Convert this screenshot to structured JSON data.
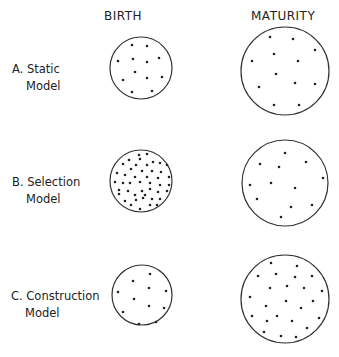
{
  "headers": {
    "birth": "BIRTH",
    "maturity": "MATURITY"
  },
  "rows": [
    {
      "letter": "A.",
      "name": "Static",
      "suffix": "Model"
    },
    {
      "letter": "B.",
      "name": "Selection",
      "suffix": "Model"
    },
    {
      "letter": "C.",
      "name": "Construction",
      "suffix": "Model"
    }
  ],
  "circles": [
    {
      "id": "A-birth",
      "cx": 141,
      "cy": 68,
      "r": 31,
      "dots": [
        [
          132,
          45
        ],
        [
          147,
          46
        ],
        [
          118,
          61
        ],
        [
          133,
          59
        ],
        [
          147,
          62
        ],
        [
          159,
          58
        ],
        [
          135,
          72
        ],
        [
          147,
          78
        ],
        [
          162,
          77
        ],
        [
          123,
          80
        ],
        [
          132,
          92
        ],
        [
          152,
          91
        ]
      ]
    },
    {
      "id": "A-maturity",
      "cx": 285,
      "cy": 71,
      "r": 44,
      "dots": [
        [
          270,
          37
        ],
        [
          293,
          39
        ],
        [
          315,
          50
        ],
        [
          252,
          61
        ],
        [
          274,
          54
        ],
        [
          298,
          61
        ],
        [
          276,
          74
        ],
        [
          259,
          87
        ],
        [
          295,
          83
        ],
        [
          315,
          84
        ],
        [
          274,
          105
        ],
        [
          299,
          105
        ]
      ]
    },
    {
      "id": "B-birth",
      "cx": 141,
      "cy": 181,
      "r": 31,
      "dots": [
        [
          139,
          155
        ],
        [
          147,
          154
        ],
        [
          129,
          160
        ],
        [
          140,
          159
        ],
        [
          153,
          162
        ],
        [
          160,
          163
        ],
        [
          123,
          164
        ],
        [
          136,
          165
        ],
        [
          147,
          165
        ],
        [
          167,
          165
        ],
        [
          131,
          169
        ],
        [
          142,
          171
        ],
        [
          152,
          171
        ],
        [
          161,
          172
        ],
        [
          117,
          173
        ],
        [
          125,
          175
        ],
        [
          135,
          177
        ],
        [
          147,
          177
        ],
        [
          158,
          178
        ],
        [
          169,
          177
        ],
        [
          115,
          182
        ],
        [
          123,
          183
        ],
        [
          130,
          183
        ],
        [
          140,
          182
        ],
        [
          150,
          183
        ],
        [
          160,
          185
        ],
        [
          169,
          185
        ],
        [
          119,
          190
        ],
        [
          128,
          191
        ],
        [
          142,
          191
        ],
        [
          150,
          189
        ],
        [
          158,
          192
        ],
        [
          167,
          191
        ],
        [
          119,
          194
        ],
        [
          135,
          195
        ],
        [
          145,
          195
        ],
        [
          125,
          201
        ],
        [
          136,
          200
        ],
        [
          143,
          198
        ],
        [
          152,
          199
        ],
        [
          160,
          199
        ],
        [
          131,
          205
        ],
        [
          150,
          205
        ],
        [
          157,
          205
        ],
        [
          140,
          209
        ]
      ]
    },
    {
      "id": "B-maturity",
      "cx": 285,
      "cy": 183,
      "r": 43,
      "dots": [
        [
          285,
          153
        ],
        [
          260,
          164
        ],
        [
          279,
          167
        ],
        [
          306,
          162
        ],
        [
          323,
          178
        ],
        [
          250,
          185
        ],
        [
          271,
          183
        ],
        [
          295,
          188
        ],
        [
          257,
          199
        ],
        [
          291,
          207
        ],
        [
          312,
          205
        ],
        [
          281,
          217
        ]
      ]
    },
    {
      "id": "C-birth",
      "cx": 142,
      "cy": 295,
      "r": 30,
      "dots": [
        [
          150,
          274
        ],
        [
          133,
          281
        ],
        [
          149,
          288
        ],
        [
          166,
          291
        ],
        [
          118,
          292
        ],
        [
          134,
          299
        ],
        [
          149,
          306
        ],
        [
          164,
          308
        ],
        [
          123,
          312
        ],
        [
          139,
          324
        ],
        [
          156,
          322
        ]
      ]
    },
    {
      "id": "C-maturity",
      "cx": 285,
      "cy": 299,
      "r": 44,
      "dots": [
        [
          271,
          263
        ],
        [
          297,
          266
        ],
        [
          258,
          276
        ],
        [
          276,
          274
        ],
        [
          295,
          277
        ],
        [
          312,
          276
        ],
        [
          270,
          288
        ],
        [
          287,
          286
        ],
        [
          304,
          288
        ],
        [
          322,
          291
        ],
        [
          250,
          297
        ],
        [
          286,
          301
        ],
        [
          313,
          301
        ],
        [
          266,
          306
        ],
        [
          301,
          308
        ],
        [
          252,
          316
        ],
        [
          267,
          321
        ],
        [
          277,
          316
        ],
        [
          292,
          321
        ],
        [
          319,
          318
        ],
        [
          307,
          328
        ],
        [
          264,
          332
        ],
        [
          281,
          336
        ],
        [
          296,
          337
        ]
      ]
    }
  ]
}
